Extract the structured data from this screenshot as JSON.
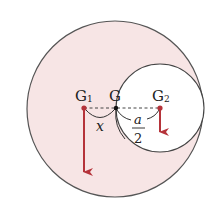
{
  "diagram": {
    "colors": {
      "disc_fill": "#f7e5e5",
      "outline": "#555555",
      "hole_fill": "#ffffff",
      "force_arrow": "#b5333a",
      "center_dot": "#b5333a",
      "combined_dot": "#111111",
      "dashed_line": "#444444"
    },
    "big_circle": {
      "cx": 115,
      "cy": 109,
      "r": 88
    },
    "small_circle": {
      "cx": 160,
      "cy": 108,
      "r": 44
    },
    "points": {
      "G1": {
        "label": "G",
        "subscript": "1",
        "x": 84,
        "y": 108
      },
      "G": {
        "label": "G",
        "x": 116,
        "y": 108
      },
      "G2": {
        "label": "G",
        "subscript": "2",
        "x": 160,
        "y": 108
      }
    },
    "dimensions": {
      "x_label": "x",
      "a_over_2": {
        "numerator": "a",
        "denominator": "2"
      }
    },
    "arrows": [
      {
        "name": "weight-G1",
        "from": [
          84,
          108
        ],
        "to": [
          84,
          172
        ]
      },
      {
        "name": "weight-G2",
        "from": [
          160,
          108
        ],
        "to": [
          160,
          132
        ]
      }
    ]
  }
}
